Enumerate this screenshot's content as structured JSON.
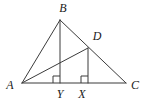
{
  "figure": {
    "canvas": {
      "width": 146,
      "height": 107,
      "background": "#ffffff"
    },
    "style": {
      "stroke_color": "#3b3b3b",
      "stroke_width": 1,
      "label_color": "#1a1a1a",
      "label_font_size": 12
    },
    "points": [
      {
        "name": "A",
        "label": "A",
        "x": 22,
        "y": 83,
        "label_x": 10,
        "label_y": 85
      },
      {
        "name": "B",
        "label": "B",
        "x": 60,
        "y": 20,
        "label_x": 63,
        "label_y": 8
      },
      {
        "name": "C",
        "label": "C",
        "x": 126,
        "y": 83,
        "label_x": 135,
        "label_y": 85
      },
      {
        "name": "D",
        "label": "D",
        "x": 88,
        "y": 48,
        "label_x": 97,
        "label_y": 36
      },
      {
        "name": "Y",
        "label": "Y",
        "x": 60,
        "y": 83,
        "label_x": 60,
        "label_y": 94
      },
      {
        "name": "X",
        "label": "X",
        "x": 88,
        "y": 83,
        "label_x": 82,
        "label_y": 94
      }
    ],
    "segments": [
      {
        "name": "segment-AB",
        "from": "A",
        "to": "B",
        "x1": 22,
        "y1": 83,
        "x2": 60,
        "y2": 20
      },
      {
        "name": "segment-BC",
        "from": "B",
        "to": "C",
        "x1": 60,
        "y1": 20,
        "x2": 126,
        "y2": 83
      },
      {
        "name": "segment-AC",
        "from": "A",
        "to": "C",
        "x1": 22,
        "y1": 83,
        "x2": 126,
        "y2": 83
      },
      {
        "name": "segment-AD",
        "from": "A",
        "to": "D",
        "x1": 22,
        "y1": 83,
        "x2": 88,
        "y2": 48
      },
      {
        "name": "segment-BY",
        "from": "B",
        "to": "Y",
        "x1": 60,
        "y1": 20,
        "x2": 60,
        "y2": 83
      },
      {
        "name": "segment-DX",
        "from": "D",
        "to": "X",
        "x1": 88,
        "y1": 48,
        "x2": 88,
        "y2": 83
      }
    ],
    "right_angles": [
      {
        "name": "right-angle-at-Y",
        "at": "Y",
        "x": 60,
        "y": 83,
        "size": 7,
        "dir_x": -1,
        "dir_y": -1
      },
      {
        "name": "right-angle-at-X",
        "at": "X",
        "x": 88,
        "y": 83,
        "size": 7,
        "dir_x": -1,
        "dir_y": -1
      }
    ]
  }
}
